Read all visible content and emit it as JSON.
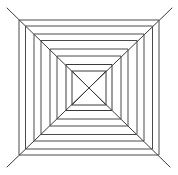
{
  "figure": {
    "style": "hand-drawn pencil line art",
    "canvas_width": 178,
    "canvas_height": 175,
    "background_color": "#ffffff",
    "line_color": "#4a4a4a",
    "line_color_dark": "#3a3a3a",
    "line_width": 1,
    "center_x": 89,
    "center_y": 88,
    "square_count": 8,
    "diagonal_count": 4,
    "squares": [
      {
        "name": "square-1-outer",
        "x": 19,
        "y": 20,
        "width": 140,
        "height": 135,
        "stroke": "#4a4a4a"
      },
      {
        "name": "square-2",
        "x": 25.5,
        "y": 26,
        "width": 127,
        "height": 123,
        "stroke": "#4a4a4a"
      },
      {
        "name": "square-3",
        "x": 34,
        "y": 34,
        "width": 110,
        "height": 107,
        "stroke": "#4a4a4a"
      },
      {
        "name": "square-4",
        "x": 41,
        "y": 40.5,
        "width": 96,
        "height": 94,
        "stroke": "#4a4a4a"
      },
      {
        "name": "square-5",
        "x": 50,
        "y": 49,
        "width": 78,
        "height": 77,
        "stroke": "#4a4a4a"
      },
      {
        "name": "square-6",
        "x": 57,
        "y": 56,
        "width": 64,
        "height": 63,
        "stroke": "#4a4a4a"
      },
      {
        "name": "square-7",
        "x": 66,
        "y": 64.5,
        "width": 46,
        "height": 46,
        "stroke": "#3a3a3a"
      },
      {
        "name": "square-8-inner",
        "x": 72,
        "y": 71,
        "width": 34,
        "height": 34,
        "stroke": "#3a3a3a"
      }
    ],
    "diagonals": [
      {
        "name": "diagonal-tl-br",
        "x1": 7,
        "y1": 8,
        "x2": 170,
        "y2": 167,
        "stroke": "#3a3a3a"
      },
      {
        "name": "diagonal-tr-bl",
        "x1": 172,
        "y1": 8,
        "x2": 7,
        "y2": 167,
        "stroke": "#3a3a3a"
      }
    ],
    "inner_x_marks": [
      {
        "name": "inner-x-stroke-a",
        "x1": 72,
        "y1": 71,
        "x2": 106,
        "y2": 105,
        "stroke": "#3a3a3a"
      },
      {
        "name": "inner-x-stroke-b",
        "x1": 106,
        "y1": 71,
        "x2": 72,
        "y2": 105,
        "stroke": "#3a3a3a"
      }
    ]
  }
}
